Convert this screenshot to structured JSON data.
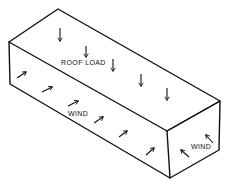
{
  "diagram": {
    "title": "",
    "type": "isometric-box-loads",
    "stroke_color": "#111111",
    "background": "#ffffff",
    "labels": {
      "roof_load": "ROOF LOAD",
      "wind_side": "WIND",
      "wind_end": "WIND"
    },
    "faces": [
      "top (roof)",
      "front long face",
      "end face"
    ],
    "arrows": {
      "roof_load": {
        "direction": "down",
        "count": 6
      },
      "wind_side": {
        "direction": "up-right",
        "count": 7
      },
      "wind_end": {
        "direction": "up-left",
        "count": 2
      }
    }
  }
}
